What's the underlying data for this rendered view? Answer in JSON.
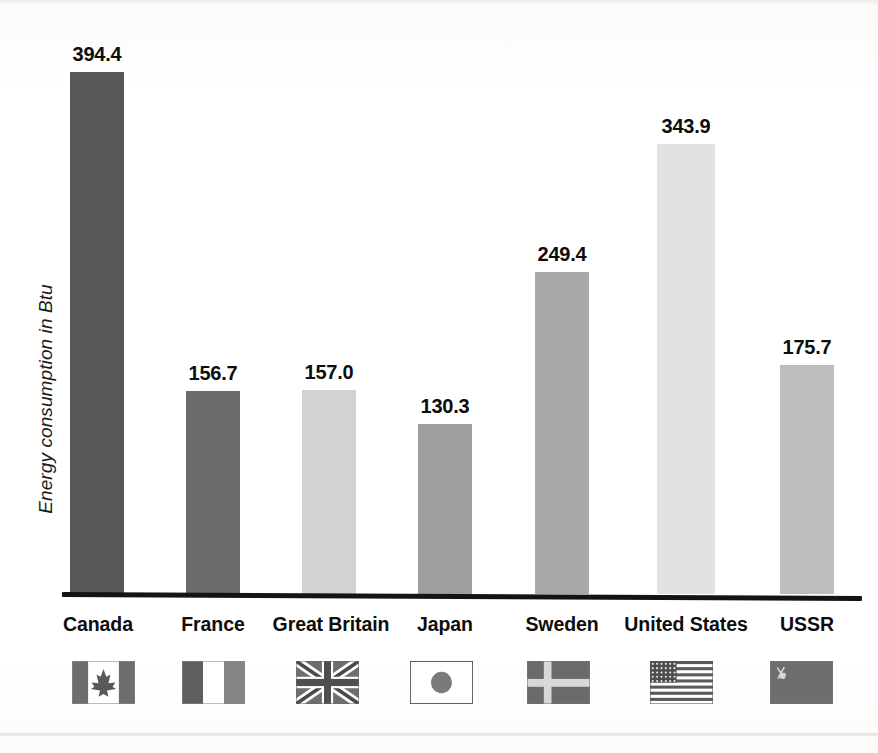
{
  "chart_data": {
    "type": "bar",
    "title": "",
    "subtitle": "",
    "xlabel": "",
    "ylabel": "Energy consumption in Btu",
    "ylim": [
      0,
      420
    ],
    "grid": false,
    "legend": "none",
    "value_labels": true,
    "categories": [
      "Canada",
      "France",
      "Great Britain",
      "Japan",
      "Sweden",
      "United States",
      "USSR"
    ],
    "values": [
      394.4,
      156.7,
      157.0,
      130.3,
      249.4,
      343.9,
      175.7
    ],
    "value_label_text": [
      "394.4",
      "156.7",
      "157.0",
      "130.3",
      "249.4",
      "343.9",
      "175.7"
    ],
    "bar_colors": [
      "#575757",
      "#6b6b6b",
      "#d2d2d2",
      "#9e9e9e",
      "#a8a8a8",
      "#e2e2e2",
      "#bdbdbd"
    ],
    "category_icons": [
      "flag-canada-icon",
      "flag-france-icon",
      "flag-great-britain-icon",
      "flag-japan-icon",
      "flag-sweden-icon",
      "flag-united-states-icon",
      "flag-ussr-icon"
    ]
  },
  "axis": {
    "y_label": "Energy consumption in Btu",
    "baseline_color": "#141414"
  },
  "bars": [
    {
      "category": "Canada",
      "value": 394.4,
      "label": "394.4",
      "color": "#575757",
      "left": 70,
      "width": 54,
      "top": 72,
      "label_top": 43,
      "icon": "flag-canada-icon",
      "icon_left": 72,
      "icon_width": 63,
      "cat_left": 48,
      "cat_width": 100
    },
    {
      "category": "France",
      "value": 156.7,
      "label": "156.7",
      "color": "#6b6b6b",
      "left": 186,
      "width": 54,
      "top": 391,
      "label_top": 362,
      "icon": "flag-france-icon",
      "icon_left": 182,
      "icon_width": 63,
      "cat_left": 163,
      "cat_width": 100
    },
    {
      "category": "Great Britain",
      "value": 157.0,
      "label": "157.0",
      "color": "#d2d2d2",
      "left": 302,
      "width": 54,
      "top": 390,
      "label_top": 361,
      "icon": "flag-great-britain-icon",
      "icon_left": 296,
      "icon_width": 63,
      "cat_left": 261,
      "cat_width": 140
    },
    {
      "category": "Japan",
      "value": 130.3,
      "label": "130.3",
      "color": "#9e9e9e",
      "left": 418,
      "width": 54,
      "top": 424,
      "label_top": 395,
      "icon": "flag-japan-icon",
      "icon_left": 410,
      "icon_width": 63,
      "cat_left": 395,
      "cat_width": 100
    },
    {
      "category": "Sweden",
      "value": 249.4,
      "label": "249.4",
      "color": "#a8a8a8",
      "left": 535,
      "width": 54,
      "top": 272,
      "label_top": 243,
      "icon": "flag-sweden-icon",
      "icon_left": 527,
      "icon_width": 63,
      "cat_left": 512,
      "cat_width": 100
    },
    {
      "category": "United States",
      "value": 343.9,
      "label": "343.9",
      "color": "#e2e2e2",
      "left": 657,
      "width": 58,
      "top": 144,
      "label_top": 115,
      "icon": "flag-united-states-icon",
      "icon_left": 650,
      "icon_width": 63,
      "cat_left": 616,
      "cat_width": 140
    },
    {
      "category": "USSR",
      "value": 175.7,
      "label": "175.7",
      "color": "#bdbdbd",
      "left": 780,
      "width": 54,
      "top": 365,
      "label_top": 336,
      "icon": "flag-ussr-icon",
      "icon_left": 770,
      "icon_width": 63,
      "cat_left": 757,
      "cat_width": 100
    }
  ]
}
